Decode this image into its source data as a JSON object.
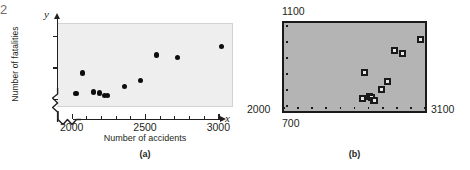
{
  "figure": {
    "fragment_text": "2",
    "panels": [
      {
        "label": "(a)"
      },
      {
        "label": "(b)"
      }
    ]
  },
  "panel_a": {
    "caption": "(a)",
    "y_axis_symbol": "y",
    "x_axis_symbol": "x",
    "y_axis_title": "Number of fatalities",
    "x_axis_title": "Number of accidents",
    "y_ticks": [
      "700",
      "900",
      "1100"
    ],
    "x_ticks": [
      "2000",
      "2500",
      "3000"
    ],
    "axis_break": true
  },
  "panel_b": {
    "caption": "(b)",
    "window_ymax": "1100",
    "window_ymin": "2000",
    "window_xmin": "700",
    "window_xmax": "3100",
    "marker_style": "small-square"
  },
  "chart_data": [
    {
      "type": "scatter",
      "title": "",
      "subtitle": "(a)",
      "xlabel": "Number of accidents",
      "ylabel": "Number of fatalities",
      "xlim": [
        1900,
        3100
      ],
      "ylim": [
        650,
        1180
      ],
      "xticks": [
        2000,
        2500,
        3000
      ],
      "yticks": [
        700,
        900,
        1100
      ],
      "grid": false,
      "legend": false,
      "axis_break_x": true,
      "axis_break_y": true,
      "points": [
        {
          "x": 2030,
          "y": 740
        },
        {
          "x": 2075,
          "y": 870
        },
        {
          "x": 2150,
          "y": 750
        },
        {
          "x": 2190,
          "y": 745
        },
        {
          "x": 2225,
          "y": 730
        },
        {
          "x": 2245,
          "y": 730
        },
        {
          "x": 2360,
          "y": 785
        },
        {
          "x": 2470,
          "y": 825
        },
        {
          "x": 2580,
          "y": 985
        },
        {
          "x": 2720,
          "y": 970
        },
        {
          "x": 3020,
          "y": 1040
        }
      ]
    },
    {
      "type": "scatter",
      "title": "",
      "subtitle": "(b)",
      "xlabel": "",
      "ylabel": "",
      "xlim": [
        700,
        3100
      ],
      "ylim": [
        2000,
        1100
      ],
      "xticks": [
        700,
        940,
        1180,
        1420,
        1660,
        1900,
        2140,
        2380,
        2620,
        2860,
        3100
      ],
      "yticks": [],
      "grid": false,
      "legend": false,
      "note": "calculator viewing window: Xmin=700, Xmax=3100, Ymin=2000, Ymax=1100",
      "points": [
        {
          "x": 2030,
          "y": 740
        },
        {
          "x": 2075,
          "y": 870
        },
        {
          "x": 2150,
          "y": 750
        },
        {
          "x": 2190,
          "y": 745
        },
        {
          "x": 2225,
          "y": 730
        },
        {
          "x": 2245,
          "y": 730
        },
        {
          "x": 2360,
          "y": 785
        },
        {
          "x": 2470,
          "y": 825
        },
        {
          "x": 2580,
          "y": 985
        },
        {
          "x": 2720,
          "y": 970
        },
        {
          "x": 3020,
          "y": 1040
        }
      ]
    }
  ]
}
